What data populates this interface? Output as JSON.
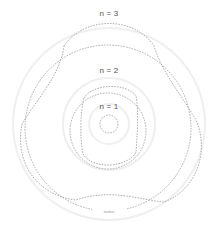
{
  "diagram": {
    "labels": [
      {
        "id": "n3",
        "text": "n = 3",
        "x": 109,
        "y": 10
      },
      {
        "id": "n2",
        "text": "n = 2",
        "x": 109,
        "y": 67
      },
      {
        "id": "n1",
        "text": "n = 1",
        "x": 109,
        "y": 104
      }
    ],
    "caption": "nucleus",
    "colors": {
      "line": "#9a9a9a",
      "faint": "#ececec",
      "label": "#555555"
    },
    "orbits": [
      {
        "n": 1,
        "cx": 109,
        "cy": 124,
        "r": 9,
        "lobes": 0
      },
      {
        "n": 2,
        "cx": 108,
        "cy": 127,
        "r": 40,
        "lobes": 4,
        "amp": 6
      },
      {
        "n": 3,
        "cx": 108,
        "cy": 122,
        "r": 86,
        "lobes": 3,
        "amp": 12
      }
    ]
  }
}
